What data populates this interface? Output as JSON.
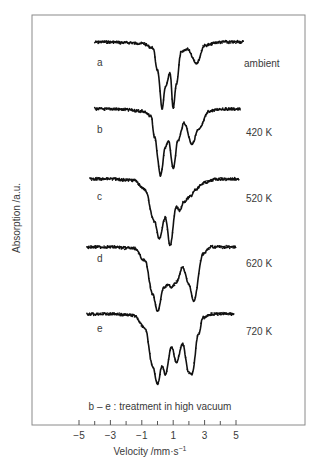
{
  "chart_data": {
    "type": "line",
    "title": "",
    "xlabel": "Velocity /mm·s⁻¹",
    "ylabel": "Absorption /a.u.",
    "xlim": [
      -5,
      5
    ],
    "x_ticks": [
      -5,
      -4,
      -3,
      -2,
      -1,
      0,
      1,
      2,
      3,
      4,
      5
    ],
    "x_tick_labels": [
      "−5",
      "−3",
      "−1",
      "1",
      "3",
      "5"
    ],
    "x_tick_label_values": [
      -5,
      -3,
      -1,
      1,
      3,
      5
    ],
    "grid": false,
    "legend": "none",
    "annotation": "b – e : treatment in high vacuum",
    "series": [
      {
        "name": "a",
        "condition": "ambient",
        "x": [
          -4.0,
          -3.0,
          -2.0,
          -1.0,
          -0.3,
          0.0,
          0.3,
          0.5,
          0.8,
          1.0,
          1.2,
          1.5,
          1.9,
          2.5,
          3.0,
          4.0,
          5.5
        ],
        "y": [
          0.0,
          0.0,
          0.01,
          0.02,
          0.08,
          0.4,
          0.95,
          0.65,
          0.45,
          0.95,
          0.6,
          0.15,
          0.1,
          0.3,
          0.05,
          0.0,
          0.0
        ]
      },
      {
        "name": "b",
        "condition": "420 K",
        "x": [
          -4.0,
          -3.0,
          -2.0,
          -1.0,
          -0.4,
          -0.2,
          0.2,
          0.5,
          0.7,
          1.0,
          1.3,
          1.7,
          2.2,
          2.6,
          3.3,
          4.0,
          5.3
        ],
        "y": [
          0.0,
          0.0,
          0.01,
          0.03,
          0.1,
          0.4,
          0.95,
          0.55,
          0.45,
          0.85,
          0.45,
          0.2,
          0.5,
          0.3,
          0.03,
          0.0,
          0.0
        ]
      },
      {
        "name": "c",
        "condition": "520 K",
        "x": [
          -4.3,
          -3.0,
          -1.5,
          -0.8,
          -0.2,
          0.1,
          0.5,
          0.8,
          1.2,
          1.4,
          1.7,
          2.1,
          2.4,
          3.0,
          3.8,
          5.2
        ],
        "y": [
          0.0,
          0.0,
          0.02,
          0.15,
          0.6,
          0.85,
          0.55,
          0.95,
          0.4,
          0.45,
          0.32,
          0.25,
          0.15,
          0.05,
          0.0,
          0.0
        ]
      },
      {
        "name": "d",
        "condition": "620 K",
        "x": [
          -4.5,
          -3.0,
          -1.5,
          -0.8,
          -0.3,
          0.0,
          0.4,
          0.7,
          0.9,
          1.2,
          1.6,
          2.0,
          2.3,
          2.9,
          3.4,
          5.0
        ],
        "y": [
          0.0,
          0.0,
          0.02,
          0.2,
          0.7,
          0.95,
          0.6,
          0.55,
          0.6,
          0.52,
          0.3,
          0.55,
          0.8,
          0.1,
          0.0,
          0.0
        ]
      },
      {
        "name": "e",
        "condition": "720 K",
        "x": [
          -4.5,
          -3.0,
          -1.5,
          -0.8,
          -0.3,
          0.0,
          0.3,
          0.5,
          0.9,
          1.2,
          1.6,
          2.0,
          2.2,
          2.6,
          2.9,
          3.5,
          4.9
        ],
        "y": [
          0.0,
          0.0,
          0.02,
          0.2,
          0.75,
          1.0,
          0.74,
          0.86,
          0.47,
          0.69,
          0.43,
          0.84,
          0.86,
          0.3,
          0.05,
          0.0,
          0.0
        ]
      }
    ]
  },
  "labels": {
    "ylabel": "Absorption /a.u.",
    "xlabel_main": "Velocity /mm·s",
    "xlabel_sup": "−1",
    "annotation": "b – e : treatment in high vacuum",
    "ticks": [
      "−5",
      "−3",
      "−1",
      "1",
      "3",
      "5"
    ],
    "series_letters": [
      "a",
      "b",
      "c",
      "d",
      "e"
    ],
    "conditions": [
      "ambient",
      "420 K",
      "520 K",
      "620 K",
      "720 K"
    ]
  }
}
